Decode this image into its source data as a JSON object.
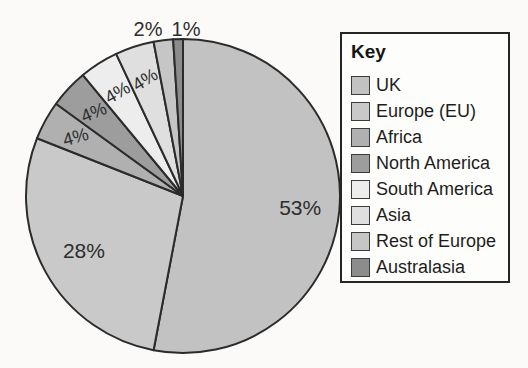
{
  "chart_data": {
    "type": "pie",
    "legend": {
      "title": "Key",
      "position": "right"
    },
    "slices": [
      {
        "label": "UK",
        "value": 53,
        "pct_label": "53%",
        "color": "#c2c2c2"
      },
      {
        "label": "Europe (EU)",
        "value": 28,
        "pct_label": "28%",
        "color": "#c9c9c9"
      },
      {
        "label": "Africa",
        "value": 4,
        "pct_label": "4%",
        "color": "#b0b0b0"
      },
      {
        "label": "North America",
        "value": 4,
        "pct_label": "4%",
        "color": "#9d9d9d"
      },
      {
        "label": "South America",
        "value": 4,
        "pct_label": "4%",
        "color": "#ededed"
      },
      {
        "label": "Asia",
        "value": 4,
        "pct_label": "4%",
        "color": "#dfdfdf"
      },
      {
        "label": "Rest of Europe",
        "value": 2,
        "pct_label": "2%",
        "color": "#c6c6c6"
      },
      {
        "label": "Australasia",
        "value": 1,
        "pct_label": "1%",
        "color": "#8c8c8c"
      }
    ],
    "start_angle_deg": 0,
    "direction": "clockwise",
    "layout": {
      "center": [
        183,
        196
      ],
      "radius": 157,
      "stroke": "#2b2b2b",
      "stroke_width": 2,
      "text_color": "#2d2d2d",
      "label_style": [
        {
          "r": 0.75,
          "size": 21,
          "rotation": 0
        },
        {
          "r": 0.72,
          "size": 21,
          "rotation": 0
        },
        {
          "r": 0.78,
          "size": 18,
          "rotation": -15
        },
        {
          "r": 0.78,
          "size": 18,
          "rotation": -22
        },
        {
          "r": 0.78,
          "size": 18,
          "rotation": -30
        },
        {
          "r": 0.78,
          "size": 18,
          "rotation": -32
        },
        {
          "size": 20,
          "rotation": 0,
          "pos": [
            148,
            29
          ]
        },
        {
          "size": 20,
          "rotation": 0,
          "pos": [
            186,
            29
          ]
        }
      ]
    }
  }
}
